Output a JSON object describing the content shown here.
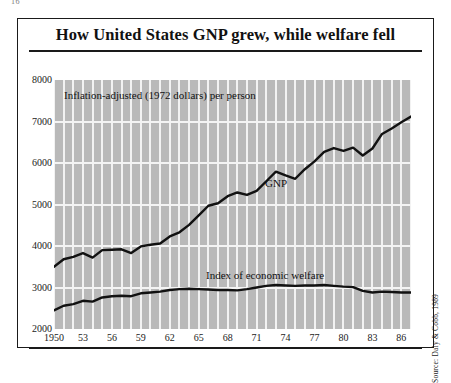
{
  "page": {
    "corner_number": "16"
  },
  "figure": {
    "title": "How United States GNP grew, while welfare fell",
    "subtitle_note": "Inflation-adjusted (1972 dollars) per person",
    "source_credit": "Source: Daly & Cobb, 1989",
    "series_labels": {
      "gnp": "GNP",
      "welfare": "Index of economic welfare"
    }
  },
  "chart_data": {
    "type": "line",
    "title": "How United States GNP grew, while welfare fell",
    "subtitle": "Inflation-adjusted (1972 dollars) per person",
    "xlabel": "",
    "ylabel": "",
    "ylim": [
      2000,
      8000
    ],
    "xlim": [
      1950,
      1987
    ],
    "ytick_labels": [
      "8000",
      "7000",
      "6000",
      "5000",
      "4000",
      "3000",
      "2000"
    ],
    "ytick_values": [
      8000,
      7000,
      6000,
      5000,
      4000,
      3000,
      2000
    ],
    "xtick_labels": [
      "1950",
      "53",
      "56",
      "59",
      "62",
      "65",
      "68",
      "71",
      "74",
      "77",
      "80",
      "83",
      "86"
    ],
    "xtick_values": [
      1950,
      1953,
      1956,
      1959,
      1962,
      1965,
      1968,
      1971,
      1974,
      1977,
      1980,
      1983,
      1986
    ],
    "grid": "vertical-annual-and-horizontal-major",
    "legend": "inline-annotations",
    "plot_background": "#b9b9b9",
    "gridline_color": "#f2f2f2",
    "line_color": "#111111",
    "x": [
      1950,
      1951,
      1952,
      1953,
      1954,
      1955,
      1956,
      1957,
      1958,
      1959,
      1960,
      1961,
      1962,
      1963,
      1964,
      1965,
      1966,
      1967,
      1968,
      1969,
      1970,
      1971,
      1972,
      1973,
      1974,
      1975,
      1976,
      1977,
      1978,
      1979,
      1980,
      1981,
      1982,
      1983,
      1984,
      1985,
      1986,
      1987
    ],
    "series": [
      {
        "name": "GNP",
        "values": [
          3500,
          3680,
          3740,
          3830,
          3720,
          3900,
          3910,
          3920,
          3830,
          3990,
          4030,
          4060,
          4230,
          4330,
          4510,
          4740,
          4970,
          5030,
          5200,
          5290,
          5230,
          5330,
          5560,
          5790,
          5700,
          5620,
          5850,
          6040,
          6270,
          6360,
          6290,
          6370,
          6180,
          6350,
          6700,
          6830,
          6980,
          7120
        ]
      },
      {
        "name": "Index of economic welfare",
        "values": [
          2450,
          2560,
          2600,
          2680,
          2660,
          2760,
          2790,
          2800,
          2790,
          2860,
          2880,
          2900,
          2940,
          2960,
          2970,
          2960,
          2950,
          2940,
          2940,
          2930,
          2960,
          3000,
          3040,
          3060,
          3050,
          3040,
          3050,
          3050,
          3060,
          3040,
          3020,
          3010,
          2920,
          2880,
          2900,
          2890,
          2880,
          2880
        ]
      }
    ]
  }
}
